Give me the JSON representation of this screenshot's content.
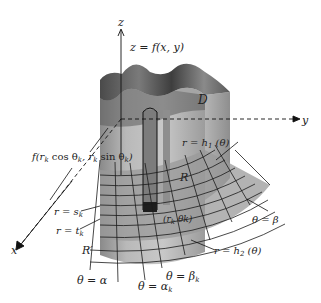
{
  "figure": {
    "colors": {
      "background": "#ffffff",
      "surface_top": "#6f6f6f",
      "surface_dark": "#3c3c3c",
      "solid_side": "#a8a8a8",
      "solid_front": "#bdbdbd",
      "region_R": "#9a9a9a",
      "grid_lines": "#1a1a1a",
      "column_dark": "#1e1e1e",
      "labels": "#222222"
    }
  },
  "axes": {
    "z": "z",
    "y": "y",
    "x": "x"
  },
  "labels": {
    "surface": "z = f(x, y)",
    "domain": "D",
    "height_prefix": "f(r",
    "height_k1": "k",
    "height_cos": " cos θ",
    "height_k2": "k",
    "height_comma": ", r",
    "height_k3": "k",
    "height_sin": " sin θ",
    "height_k4": "k",
    "height_suffix": ")",
    "r_h1": "r = h",
    "r_h1_sub": "1",
    "r_h1_arg": " (θ)",
    "R_region": "R",
    "theta_beta": "θ = β",
    "r_sk": "r = s",
    "r_sk_sub": "k",
    "r_tk": "r = t",
    "r_tk_sub": "k",
    "point": "(r",
    "point_sub": "k",
    "point_theta": " θk)",
    "R_prime": "R′",
    "r_h2": "r = h",
    "r_h2_sub": "2",
    "r_h2_arg": " (θ)",
    "theta_alpha": "θ = α",
    "theta_alpha_k": "θ = α",
    "theta_alpha_k_sub": "k",
    "theta_beta_k": "θ = β",
    "theta_beta_k_sub": "k"
  }
}
